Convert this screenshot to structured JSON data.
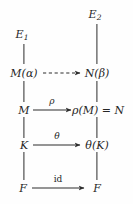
{
  "diagram": {
    "ink_color": "#262626",
    "background_color": "#fefefe",
    "left_column_x": 24,
    "right_column_x": 97,
    "rows": [
      {
        "id": "row-e",
        "y": 36,
        "left": "E1",
        "right": "E2"
      },
      {
        "id": "row-extension",
        "y": 73,
        "left": "M(alpha)",
        "right": "N(beta)"
      },
      {
        "id": "row-m",
        "y": 110,
        "left": "M",
        "right": "rho(M) = N"
      },
      {
        "id": "row-k",
        "y": 145,
        "left": "K",
        "right": "theta(K)"
      },
      {
        "id": "row-f",
        "y": 188,
        "left": "F",
        "right": "F"
      }
    ],
    "nodes": {
      "e1": {
        "base": "E",
        "sub": "1",
        "x": 22,
        "y": 36
      },
      "e2": {
        "base": "E",
        "sub": "2",
        "x": 95,
        "y": 16
      },
      "m_alpha": {
        "text": "M(α)",
        "x": 24,
        "y": 73
      },
      "n_beta": {
        "text": "N(β)",
        "x": 97,
        "y": 73
      },
      "m": {
        "text": "M",
        "x": 24,
        "y": 110
      },
      "rho_m_eq_n": {
        "text": "ρ(M) = N",
        "x": 98,
        "y": 110
      },
      "k": {
        "text": "K",
        "x": 24,
        "y": 145
      },
      "theta_k": {
        "text": "θ(K)",
        "x": 97,
        "y": 145
      },
      "f_left": {
        "text": "F",
        "x": 23,
        "y": 188
      },
      "f_right": {
        "text": "F",
        "x": 97,
        "y": 188
      }
    },
    "vertical_edges": [
      {
        "name": "edge-e1-to-m-alpha",
        "x": 24,
        "y1": 44,
        "y2": 64,
        "style": "solid"
      },
      {
        "name": "edge-e2-to-n-beta",
        "x": 97,
        "y1": 24,
        "y2": 64,
        "style": "solid"
      },
      {
        "name": "edge-m-alpha-to-m",
        "x": 24,
        "y1": 81,
        "y2": 102,
        "style": "solid"
      },
      {
        "name": "edge-n-beta-to-rho-m",
        "x": 97,
        "y1": 81,
        "y2": 102,
        "style": "solid"
      },
      {
        "name": "edge-m-to-k",
        "x": 24,
        "y1": 117,
        "y2": 138,
        "style": "solid"
      },
      {
        "name": "edge-rho-m-to-theta-k",
        "x": 97,
        "y1": 117,
        "y2": 138,
        "style": "solid"
      },
      {
        "name": "edge-k-to-f",
        "x": 24,
        "y1": 152,
        "y2": 180,
        "style": "solid"
      },
      {
        "name": "edge-theta-k-to-f",
        "x": 97,
        "y1": 152,
        "y2": 180,
        "style": "solid"
      }
    ],
    "horizontal_arrows": [
      {
        "name": "arrow-m-alpha-to-n-beta",
        "label": "",
        "label_style": "italic",
        "style": "dashed",
        "x1": 43,
        "x2": 81,
        "y": 73,
        "label_x": 62,
        "label_y": 64
      },
      {
        "name": "arrow-rho",
        "label": "ρ",
        "label_style": "italic",
        "style": "solid",
        "x1": 33,
        "x2": 72,
        "y": 110,
        "label_x": 52,
        "label_y": 100
      },
      {
        "name": "arrow-theta",
        "label": "θ",
        "label_style": "italic",
        "style": "solid",
        "x1": 33,
        "x2": 81,
        "y": 145,
        "label_x": 57,
        "label_y": 135
      },
      {
        "name": "arrow-id",
        "label": "id",
        "label_style": "roman",
        "style": "solid",
        "x1": 32,
        "x2": 85,
        "y": 188,
        "label_x": 58,
        "label_y": 178
      }
    ]
  }
}
